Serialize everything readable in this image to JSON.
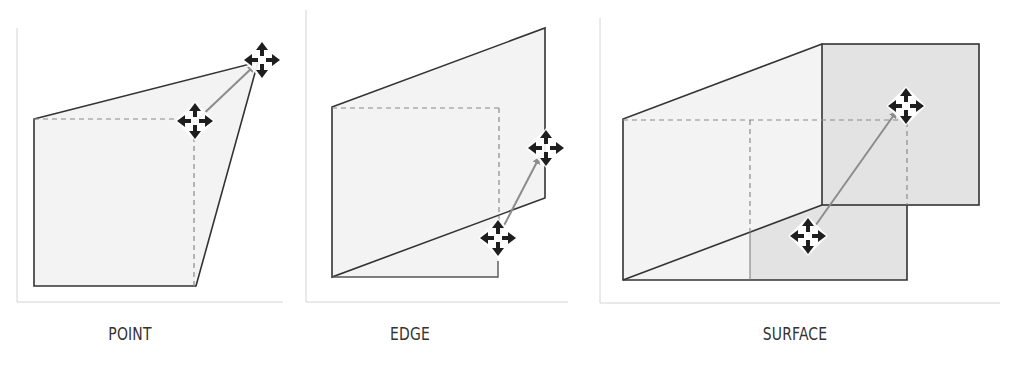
{
  "figure": {
    "colors": {
      "light_face": "#f3f3f3",
      "dark_face": "#e3e3e3",
      "outline": "#333333",
      "dashed": "#8a8a8a",
      "axis": "#d4d4d4",
      "drag_arrow": "#8c8c8c",
      "move_icon": "#1e1e1e"
    },
    "panels": [
      {
        "id": "point",
        "label": "POINT",
        "label_x": 130,
        "description": "Dragging a single vertex of a rectangle moves that corner, stretching the shape",
        "axes": {
          "left_x": 17,
          "top_y": 28,
          "bottom_y": 302,
          "right_x": 283
        },
        "outline": [
          [
            34,
            119
          ],
          [
            258,
            62
          ],
          [
            196,
            286
          ],
          [
            34,
            286
          ]
        ],
        "dashed": [
          [
            [
              34,
              119
            ],
            [
              194,
              119
            ]
          ],
          [
            [
              194,
              119
            ],
            [
              194,
              286
            ]
          ]
        ],
        "drag_arrow": {
          "from": [
            196,
            121
          ],
          "to": [
            258,
            62
          ]
        },
        "move_icons": [
          [
            195,
            121
          ],
          [
            262,
            60
          ]
        ]
      },
      {
        "id": "edge",
        "label": "EDGE",
        "label_x": 410,
        "description": "Dragging an edge moves both of its endpoints together",
        "axes": {
          "left_x": 306,
          "top_y": 10,
          "bottom_y": 302,
          "right_x": 568
        },
        "outline": [
          [
            332,
            107
          ],
          [
            545,
            28
          ],
          [
            545,
            198
          ],
          [
            332,
            277
          ]
        ],
        "outline_extra": [
          [
            332,
            277
          ],
          [
            498,
            277
          ],
          [
            498,
            260
          ]
        ],
        "dashed": [
          [
            [
              332,
              108
            ],
            [
              499,
              108
            ]
          ],
          [
            [
              499,
              108
            ],
            [
              499,
              232
            ]
          ]
        ],
        "drag_arrow": {
          "from": [
            498,
            237
          ],
          "to": [
            542,
            153
          ]
        },
        "move_icons": [
          [
            498,
            237
          ],
          [
            546,
            148
          ]
        ]
      },
      {
        "id": "surface",
        "label": "SURFACE",
        "label_x": 795,
        "description": "Dragging a surface moves the whole face, extruding the box",
        "axes": {
          "left_x": 600,
          "top_y": 18,
          "bottom_y": 303,
          "right_x": 1000
        },
        "front_face": [
          [
            623,
            119
          ],
          [
            907,
            119
          ],
          [
            907,
            280
          ],
          [
            623,
            280
          ]
        ],
        "top_face": [
          [
            623,
            119
          ],
          [
            822,
            44
          ],
          [
            907,
            44
          ],
          [
            907,
            119
          ]
        ],
        "back_face": [
          [
            822,
            44
          ],
          [
            979,
            44
          ],
          [
            979,
            205
          ],
          [
            822,
            205
          ]
        ],
        "lower_overlap": [
          [
            750,
            232
          ],
          [
            822,
            205
          ],
          [
            907,
            205
          ],
          [
            907,
            280
          ],
          [
            750,
            280
          ]
        ],
        "dashed": [
          [
            [
              623,
              120
            ],
            [
              907,
              120
            ]
          ],
          [
            [
              750,
              120
            ],
            [
              750,
              232
            ]
          ],
          [
            [
              907,
              120
            ],
            [
              907,
              205
            ]
          ]
        ],
        "drag_arrow": {
          "from": [
            807,
            236
          ],
          "to": [
            900,
            107
          ]
        },
        "move_icons": [
          [
            808,
            236
          ],
          [
            906,
            106
          ]
        ]
      }
    ]
  }
}
